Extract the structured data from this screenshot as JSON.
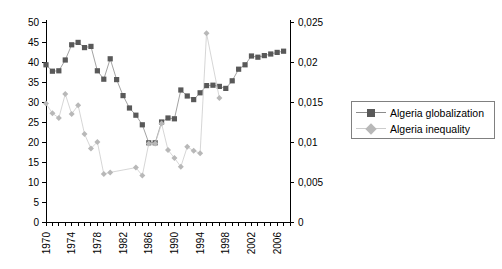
{
  "chart_data": {
    "type": "line",
    "title": "",
    "subtitle": "",
    "xlabel": "",
    "ylabel": "",
    "y2label": "",
    "grid": false,
    "legend_position": "right",
    "xlim": [
      1970,
      2008
    ],
    "ylim": [
      0,
      50
    ],
    "y2lim": [
      0,
      0.025
    ],
    "x_tick_labels": [
      "1970",
      "1974",
      "1978",
      "1982",
      "1986",
      "1990",
      "1994",
      "1998",
      "2002",
      "2006"
    ],
    "x_tick_values": [
      1970,
      1974,
      1978,
      1982,
      1986,
      1990,
      1994,
      1998,
      2002,
      2006
    ],
    "y_left_tick_labels": [
      "0",
      "5",
      "10",
      "15",
      "20",
      "25",
      "30",
      "35",
      "40",
      "45",
      "50"
    ],
    "y_left_tick_values": [
      0,
      5,
      10,
      15,
      20,
      25,
      30,
      35,
      40,
      45,
      50
    ],
    "y_right_tick_labels": [
      "0",
      "0,005",
      "0,01",
      "0,015",
      "0,02",
      "0,025"
    ],
    "y_right_tick_values": [
      0,
      0.005,
      0.01,
      0.015,
      0.02,
      0.025
    ],
    "series": [
      {
        "name": "Algeria globalization",
        "axis": "left",
        "marker": "square",
        "color": "#595959",
        "line_color": "#8c8c8c",
        "x": [
          1970,
          1971,
          1972,
          1973,
          1974,
          1975,
          1976,
          1977,
          1978,
          1979,
          1980,
          1981,
          1982,
          1983,
          1984,
          1985,
          1986,
          1987,
          1988,
          1989,
          1990,
          1991,
          1992,
          1993,
          1994,
          1995,
          1996,
          1997,
          1998,
          1999,
          2000,
          2001,
          2002,
          2003,
          2004,
          2005,
          2006,
          2007
        ],
        "values": [
          39.3,
          37.7,
          37.8,
          40.5,
          44.3,
          44.9,
          43.6,
          43.9,
          37.8,
          35.7,
          40.8,
          35.6,
          31.6,
          28.5,
          26.7,
          24.3,
          19.8,
          19.8,
          25.0,
          26.0,
          25.8,
          33.0,
          31.5,
          30.6,
          32.3,
          34.1,
          34.2,
          33.9,
          33.4,
          35.3,
          38.2,
          39.3,
          41.5,
          41.2,
          41.6,
          42.0,
          42.4,
          42.7
        ]
      },
      {
        "name": "Algeria inequality",
        "axis": "right",
        "marker": "diamond",
        "color": "#b8b8b8",
        "line_color": "#cccccc",
        "x": [
          1970,
          1971,
          1972,
          1973,
          1974,
          1975,
          1976,
          1977,
          1978,
          1979,
          1980,
          1984,
          1985,
          1986,
          1987,
          1988,
          1989,
          1990,
          1991,
          1992,
          1993,
          1994,
          1995,
          1997
        ],
        "values": [
          0.0148,
          0.0136,
          0.013,
          0.016,
          0.0135,
          0.0146,
          0.011,
          0.0092,
          0.01,
          0.006,
          0.0062,
          0.0068,
          0.0058,
          0.0098,
          0.0098,
          0.0123,
          0.009,
          0.008,
          0.0069,
          0.0094,
          0.0089,
          0.0086,
          0.0236,
          0.0155
        ]
      }
    ]
  },
  "legend": {
    "items": [
      {
        "label": "Algeria globalization"
      },
      {
        "label": "Algeria inequality"
      }
    ]
  }
}
